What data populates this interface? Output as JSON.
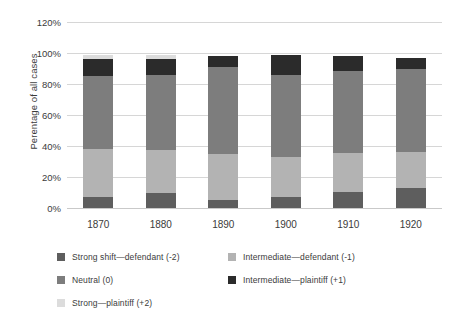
{
  "chart_data": {
    "type": "bar",
    "stacked": true,
    "stack_mode": "percent",
    "title": "",
    "xlabel": "",
    "ylabel": "Perentage of all cases",
    "ylim": [
      0,
      120
    ],
    "ytick_labels": [
      "120%",
      "100%",
      "80%",
      "60%",
      "40%",
      "20%",
      "0%"
    ],
    "ytick_values": [
      120,
      100,
      80,
      60,
      40,
      20,
      0
    ],
    "grid": true,
    "legend_position": "bottom",
    "categories": [
      "1870",
      "1880",
      "1890",
      "1900",
      "1910",
      "1920"
    ],
    "series": [
      {
        "name": "Strong shift—defendant (-2)",
        "color": "#5e5e5e",
        "values": [
          7,
          10,
          5,
          7,
          10.5,
          13
        ]
      },
      {
        "name": "Intermediate—defendant (-1)",
        "color": "#b3b3b3",
        "values": [
          31,
          27.5,
          30,
          26,
          25,
          23
        ]
      },
      {
        "name": "Neutral (0)",
        "color": "#7d7d7d",
        "values": [
          47,
          48.5,
          56,
          53,
          53,
          54
        ]
      },
      {
        "name": "Intermediate—plaintiff (+1)",
        "color": "#2b2b2b",
        "values": [
          11,
          10,
          7,
          13,
          9.5,
          7
        ]
      },
      {
        "name": "Strong—plaintiff (+2)",
        "color": "#dcdcdc",
        "values": [
          3,
          3,
          0,
          0,
          0,
          0
        ]
      }
    ]
  },
  "legend": {
    "items": [
      {
        "label": "Strong shift—defendant (-2)",
        "color": "#5e5e5e"
      },
      {
        "label": "Intermediate—defendant (-1)",
        "color": "#b3b3b3"
      },
      {
        "label": "Neutral (0)",
        "color": "#7d7d7d"
      },
      {
        "label": "Intermediate—plaintiff (+1)",
        "color": "#2b2b2b"
      },
      {
        "label": "Strong—plaintiff (+2)",
        "color": "#dcdcdc"
      }
    ]
  },
  "colors": {
    "gridline": "#d6d6d6",
    "text": "#3b3b3b",
    "background": "#ffffff"
  }
}
